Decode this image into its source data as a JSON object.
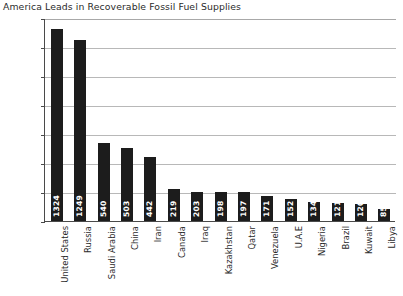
{
  "chart_data": {
    "type": "bar",
    "title": "America Leads in Recoverable Fossil Fuel Supplies",
    "xlabel": "",
    "ylabel": "Billion Barrels of Oil Equivalent",
    "ylim": [
      0,
      1400
    ],
    "yticks": [
      0,
      200,
      400,
      600,
      800,
      1000,
      1200,
      1400
    ],
    "ytick_labels": [
      "0",
      "200",
      "400",
      "600",
      "800",
      "1000",
      "1200",
      "1400"
    ],
    "grid": true,
    "legend": null,
    "bar_color": "#1c1c1c",
    "grid_color": "#b8b8b8",
    "value_label_color": "#ffffff",
    "categories": [
      "United States",
      "Russia",
      "Saudi Arabia",
      "China",
      "Iran",
      "Canada",
      "Iraq",
      "Kazakhstan",
      "Qatar",
      "Venezuela",
      "U.A.E",
      "Nigeria",
      "Brazil",
      "Kuwait",
      "Libya"
    ],
    "values": [
      1324,
      1249,
      540,
      503,
      442,
      219,
      203,
      198,
      197,
      171,
      152,
      134,
      121,
      120,
      85
    ],
    "value_labels": [
      "1324",
      "1249",
      "540",
      "503",
      "442",
      "219",
      "203",
      "198",
      "197",
      "171",
      "152",
      "134",
      "121",
      "120",
      "85"
    ]
  }
}
